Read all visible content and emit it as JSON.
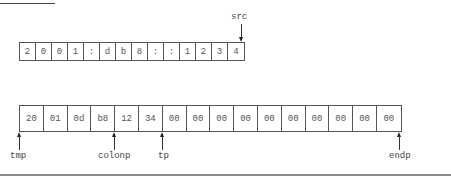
{
  "diagram": {
    "src_string": {
      "cells": [
        "2",
        "0",
        "0",
        "1",
        ":",
        "d",
        "b",
        "8",
        ":",
        ":",
        "1",
        "2",
        "3",
        "4"
      ],
      "pointer": {
        "label": "src",
        "position": "end"
      }
    },
    "tmp_buffer": {
      "cells": [
        "20",
        "01",
        "0d",
        "b8",
        "12",
        "34",
        "00",
        "00",
        "00",
        "00",
        "00",
        "00",
        "00",
        "00",
        "00",
        "00"
      ],
      "pointers": [
        {
          "label": "tmp",
          "index": 0
        },
        {
          "label": "colonp",
          "index": 4
        },
        {
          "label": "tp",
          "index": 6
        },
        {
          "label": "endp",
          "index": 16
        }
      ]
    }
  }
}
